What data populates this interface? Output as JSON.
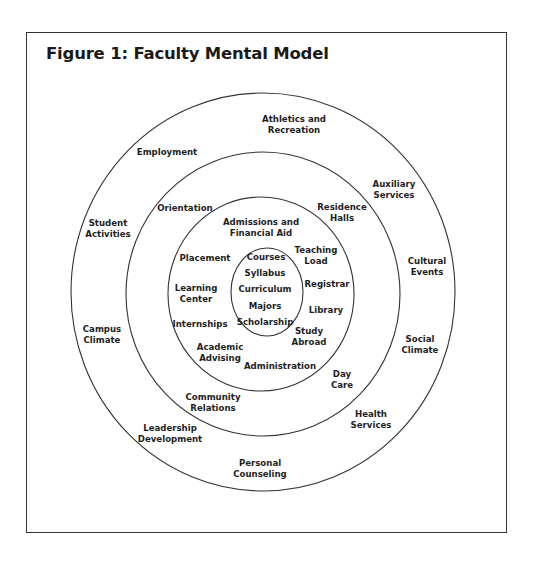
{
  "figure": {
    "title": "Figure 1: Faculty Mental Model",
    "rings": [
      {
        "name": "outer",
        "cx": 263,
        "cy": 292,
        "rx": 192,
        "ry": 199
      },
      {
        "name": "second",
        "cx": 263,
        "cy": 294,
        "rx": 137,
        "ry": 142
      },
      {
        "name": "third",
        "cx": 261,
        "cy": 294,
        "rx": 93,
        "ry": 97
      },
      {
        "name": "core",
        "cx": 267,
        "cy": 292,
        "rx": 36,
        "ry": 44
      }
    ],
    "core": {
      "l1": "Courses",
      "l2": "Syllabus",
      "l3": "Curriculum",
      "l4": "Majors",
      "l5": "Scholarship"
    },
    "ring3": {
      "admissions": [
        "Admissions and",
        "Financial Aid"
      ],
      "placement": [
        "Placement"
      ],
      "learning_center": [
        "Learning",
        "Center"
      ],
      "internships": [
        "Internships"
      ],
      "academic_advising": [
        "Academic",
        "Advising"
      ],
      "administration": [
        "Administration"
      ],
      "study_abroad": [
        "Study",
        "Abroad"
      ],
      "library": [
        "Library"
      ],
      "registrar": [
        "Registrar"
      ],
      "teaching_load": [
        "Teaching",
        "Load"
      ]
    },
    "ring2": {
      "orientation": [
        "Orientation"
      ],
      "residence_halls": [
        "Residence",
        "Halls"
      ],
      "day_care": [
        "Day",
        "Care"
      ],
      "community_relations": [
        "Community",
        "Relations"
      ]
    },
    "ring1": {
      "athletics": [
        "Athletics and",
        "Recreation"
      ],
      "employment": [
        "Employment"
      ],
      "auxiliary": [
        "Auxiliary",
        "Services"
      ],
      "student_activities": [
        "Student",
        "Activities"
      ],
      "cultural_events": [
        "Cultural",
        "Events"
      ],
      "campus_climate": [
        "Campus",
        "Climate"
      ],
      "social_climate": [
        "Social",
        "Climate"
      ],
      "health_services": [
        "Health",
        "Services"
      ],
      "leadership": [
        "Leadership",
        "Development"
      ],
      "personal_counseling": [
        "Personal",
        "Counseling"
      ]
    }
  }
}
